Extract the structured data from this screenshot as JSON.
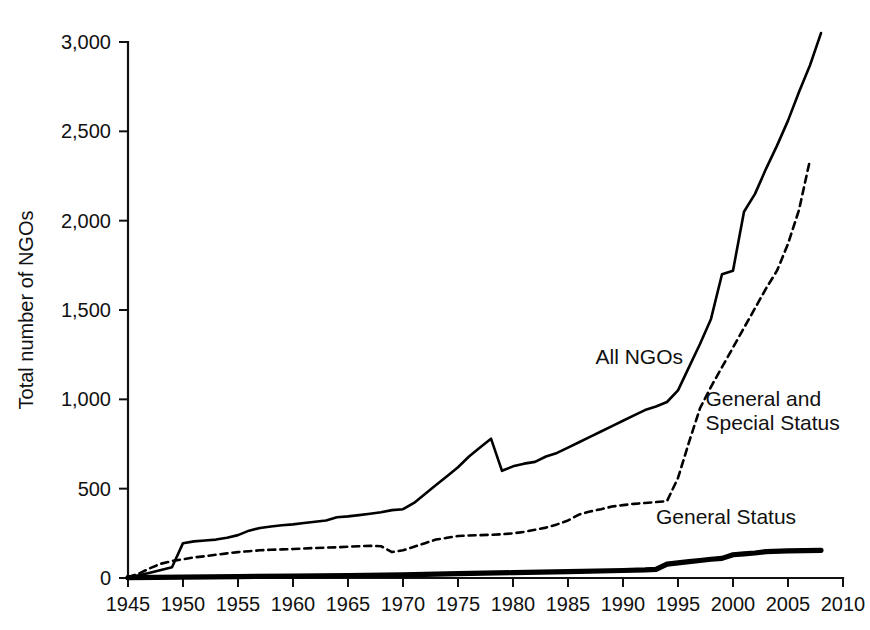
{
  "chart_data": {
    "type": "line",
    "title": "",
    "subtitle": "",
    "xlabel": "",
    "ylabel": "Total number of NGOs",
    "xlim": [
      1945,
      2010
    ],
    "ylim": [
      0,
      3000
    ],
    "grid": false,
    "legend_position": "inline-annotations",
    "x_ticks": [
      1945,
      1950,
      1955,
      1960,
      1965,
      1970,
      1975,
      1980,
      1985,
      1990,
      1995,
      2000,
      2005,
      2010
    ],
    "x_tick_labels": [
      "1945",
      "1950",
      "1955",
      "1960",
      "1965",
      "1970",
      "1975",
      "1980",
      "1985",
      "1990",
      "1995",
      "2000",
      "2005",
      "2010"
    ],
    "y_ticks": [
      0,
      500,
      1000,
      1500,
      2000,
      2500,
      3000
    ],
    "y_tick_labels": [
      "0",
      "500",
      "1,000",
      "1,500",
      "2,000",
      "2,500",
      "3,000"
    ],
    "series": [
      {
        "name": "All NGOs",
        "style": "solid",
        "annotation": "All NGOs",
        "annotation_x": 1987.5,
        "annotation_y": 1195,
        "x": [
          1945,
          1946,
          1947,
          1948,
          1949,
          1950,
          1951,
          1952,
          1953,
          1954,
          1955,
          1956,
          1957,
          1958,
          1959,
          1960,
          1961,
          1962,
          1963,
          1964,
          1965,
          1966,
          1967,
          1968,
          1969,
          1970,
          1971,
          1972,
          1973,
          1974,
          1975,
          1976,
          1977,
          1978,
          1979,
          1980,
          1981,
          1982,
          1983,
          1984,
          1985,
          1986,
          1987,
          1988,
          1989,
          1990,
          1991,
          1992,
          1993,
          1994,
          1995,
          1996,
          1997,
          1998,
          1999,
          2000,
          2001,
          2002,
          2003,
          2004,
          2005,
          2006,
          2007,
          2008
        ],
        "y": [
          5,
          15,
          30,
          45,
          60,
          195,
          205,
          210,
          215,
          225,
          240,
          265,
          280,
          288,
          295,
          300,
          308,
          315,
          322,
          340,
          345,
          352,
          360,
          368,
          380,
          385,
          420,
          470,
          520,
          570,
          620,
          680,
          730,
          780,
          600,
          625,
          640,
          650,
          680,
          700,
          730,
          760,
          790,
          820,
          850,
          880,
          910,
          940,
          960,
          985,
          1050,
          1180,
          1310,
          1450,
          1700,
          1720,
          2050,
          2150,
          2290,
          2420,
          2560,
          2720,
          2870,
          3050
        ]
      },
      {
        "name": "General and Special Status",
        "style": "dashed",
        "annotation": "General and\nSpecial Status",
        "annotation_x": 1997.5,
        "annotation_y": 960,
        "x": [
          1945,
          1946,
          1947,
          1948,
          1949,
          1950,
          1951,
          1952,
          1953,
          1954,
          1955,
          1956,
          1957,
          1958,
          1959,
          1960,
          1961,
          1962,
          1963,
          1964,
          1965,
          1966,
          1967,
          1968,
          1969,
          1970,
          1971,
          1972,
          1973,
          1974,
          1975,
          1976,
          1977,
          1978,
          1979,
          1980,
          1981,
          1982,
          1983,
          1984,
          1985,
          1986,
          1987,
          1988,
          1989,
          1990,
          1991,
          1992,
          1993,
          1994,
          1995,
          1996,
          1997,
          1998,
          1999,
          2000,
          2001,
          2002,
          2003,
          2004,
          2005,
          2006,
          2007
        ],
        "y": [
          5,
          25,
          55,
          80,
          95,
          105,
          115,
          122,
          130,
          138,
          145,
          150,
          155,
          158,
          160,
          162,
          165,
          168,
          170,
          172,
          175,
          178,
          180,
          178,
          145,
          155,
          175,
          195,
          215,
          225,
          235,
          238,
          240,
          242,
          245,
          250,
          258,
          270,
          282,
          300,
          322,
          355,
          372,
          385,
          400,
          408,
          415,
          420,
          425,
          430,
          560,
          760,
          950,
          1070,
          1180,
          1290,
          1400,
          1510,
          1620,
          1720,
          1870,
          2060,
          2340
        ]
      },
      {
        "name": "General Status",
        "style": "bold-solid",
        "annotation": "General Status",
        "annotation_x": 1993.0,
        "annotation_y": 300,
        "x": [
          1945,
          1950,
          1955,
          1960,
          1965,
          1970,
          1975,
          1980,
          1985,
          1990,
          1992,
          1993,
          1994,
          1995,
          1996,
          1997,
          1998,
          1999,
          2000,
          2001,
          2002,
          2003,
          2005,
          2008
        ],
        "y": [
          2,
          5,
          8,
          10,
          14,
          18,
          24,
          30,
          36,
          42,
          45,
          48,
          78,
          85,
          92,
          98,
          105,
          110,
          130,
          135,
          140,
          148,
          152,
          155
        ]
      }
    ]
  },
  "plot_geometry": {
    "left": 128,
    "right": 843,
    "top": 42,
    "bottom": 578,
    "x_min": 1945,
    "x_max": 2010,
    "y_min": 0,
    "y_max": 3000
  },
  "colors": {
    "ink": "#111111",
    "line": "#000000",
    "background": "#ffffff"
  }
}
